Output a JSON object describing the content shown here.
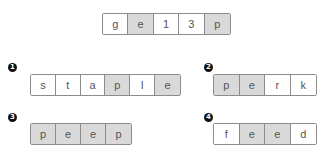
{
  "reference": {
    "cells": [
      {
        "char": "g",
        "shaded": false
      },
      {
        "char": "e",
        "shaded": true
      },
      {
        "char": "1",
        "shaded": false
      },
      {
        "char": "3",
        "shaded": false
      },
      {
        "char": "p",
        "shaded": true
      }
    ]
  },
  "options": [
    {
      "marker": "1",
      "cells": [
        {
          "char": "s",
          "shaded": false
        },
        {
          "char": "t",
          "shaded": false
        },
        {
          "char": "a",
          "shaded": false
        },
        {
          "char": "p",
          "shaded": true
        },
        {
          "char": "l",
          "shaded": false
        },
        {
          "char": "e",
          "shaded": true
        }
      ]
    },
    {
      "marker": "2",
      "cells": [
        {
          "char": "p",
          "shaded": true
        },
        {
          "char": "e",
          "shaded": true
        },
        {
          "char": "r",
          "shaded": false
        },
        {
          "char": "k",
          "shaded": false
        }
      ]
    },
    {
      "marker": "3",
      "cells": [
        {
          "char": "p",
          "shaded": true
        },
        {
          "char": "e",
          "shaded": true
        },
        {
          "char": "e",
          "shaded": true
        },
        {
          "char": "p",
          "shaded": true
        }
      ]
    },
    {
      "marker": "4",
      "cells": [
        {
          "char": "f",
          "shaded": false
        },
        {
          "char": "e",
          "shaded": true
        },
        {
          "char": "e",
          "shaded": true
        },
        {
          "char": "d",
          "shaded": false
        }
      ]
    }
  ],
  "colors": {
    "shaded_fill": "#d9d9d9",
    "plain_fill": "#ffffff",
    "border": "#8c8c8c",
    "text": "#555555",
    "marker": "#111111"
  }
}
